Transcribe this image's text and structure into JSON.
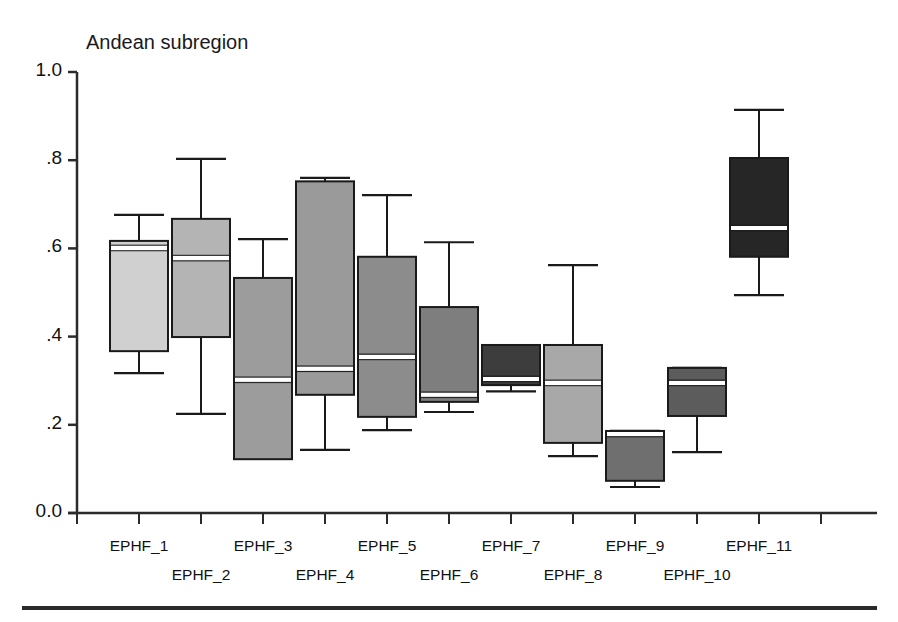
{
  "chart_data": {
    "type": "box",
    "title": "Andean subregion",
    "xlabel": "",
    "ylabel": "",
    "ylim": [
      0.0,
      1.0
    ],
    "yticks": [
      0.0,
      0.2,
      0.4,
      0.6,
      0.8,
      1.0
    ],
    "ytick_labels": [
      "0.0",
      ".2",
      ".4",
      ".6",
      ".8",
      "1.0"
    ],
    "grid": false,
    "legend": "none",
    "categories": [
      "EPHF_1",
      "EPHF_2",
      "EPHF_3",
      "EPHF_4",
      "EPHF_5",
      "EPHF_6",
      "EPHF_7",
      "EPHF_8",
      "EPHF_9",
      "EPHF_10",
      "EPHF_11"
    ],
    "boxes": [
      {
        "label": "EPHF_1",
        "whisker_low": 0.317,
        "q1": 0.367,
        "median": 0.601,
        "q3": 0.617,
        "whisker_high": 0.676,
        "fill": "#d0d0d0"
      },
      {
        "label": "EPHF_2",
        "whisker_low": 0.225,
        "q1": 0.399,
        "median": 0.578,
        "q3": 0.667,
        "whisker_high": 0.803,
        "fill": "#b4b4b4"
      },
      {
        "label": "EPHF_3",
        "whisker_low": 0.143,
        "q1": 0.122,
        "median": 0.302,
        "q3": 0.533,
        "whisker_high": 0.621,
        "fill": "#9c9c9c"
      },
      {
        "label": "EPHF_4",
        "whisker_low": 0.143,
        "q1": 0.268,
        "median": 0.327,
        "q3": 0.752,
        "whisker_high": 0.76,
        "fill": "#9a9a9a"
      },
      {
        "label": "EPHF_5",
        "whisker_low": 0.188,
        "q1": 0.218,
        "median": 0.354,
        "q3": 0.581,
        "whisker_high": 0.721,
        "fill": "#8c8c8c"
      },
      {
        "label": "EPHF_6",
        "whisker_low": 0.229,
        "q1": 0.252,
        "median": 0.268,
        "q3": 0.467,
        "whisker_high": 0.614,
        "fill": "#7e7e7e"
      },
      {
        "label": "EPHF_7",
        "whisker_low": 0.276,
        "q1": 0.29,
        "median": 0.304,
        "q3": 0.381,
        "whisker_high": 0.381,
        "fill": "#3d3d3d"
      },
      {
        "label": "EPHF_8",
        "whisker_low": 0.129,
        "q1": 0.159,
        "median": 0.295,
        "q3": 0.381,
        "whisker_high": 0.562,
        "fill": "#a8a8a8"
      },
      {
        "label": "EPHF_9",
        "whisker_low": 0.059,
        "q1": 0.073,
        "median": 0.179,
        "q3": 0.186,
        "whisker_high": 0.186,
        "fill": "#6f6f6f"
      },
      {
        "label": "EPHF_10",
        "whisker_low": 0.138,
        "q1": 0.22,
        "median": 0.295,
        "q3": 0.329,
        "whisker_high": 0.329,
        "fill": "#5c5c5c"
      },
      {
        "label": "EPHF_11",
        "whisker_low": 0.494,
        "q1": 0.581,
        "median": 0.646,
        "q3": 0.805,
        "whisker_high": 0.914,
        "fill": "#262626"
      }
    ]
  },
  "axis": {
    "y_tick_labels": [
      "1.0",
      ".8",
      ".6",
      ".4",
      ".2",
      "0.0"
    ],
    "x_tick_labels": [
      "EPHF_1",
      "EPHF_2",
      "EPHF_3",
      "EPHF_4",
      "EPHF_5",
      "EPHF_6",
      "EPHF_7",
      "EPHF_8",
      "EPHF_9",
      "EPHF_10",
      "EPHF_11"
    ]
  },
  "colors": {
    "axis": "#2b2b2b",
    "box_edge": "#1a1a1a",
    "median": "#ffffff",
    "background": "#ffffff"
  }
}
